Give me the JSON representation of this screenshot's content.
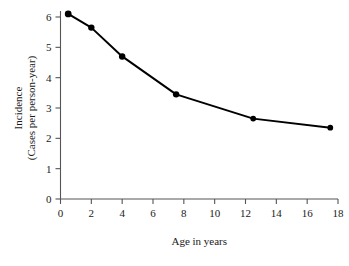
{
  "chart_data": {
    "type": "line",
    "title": "",
    "xlabel": "Age in years",
    "ylabel_line1": "Incidence",
    "ylabel_line2": "(Cases per person-year)",
    "x": [
      0.5,
      2.0,
      4.0,
      7.5,
      12.5,
      17.5
    ],
    "values": [
      6.1,
      5.65,
      4.7,
      3.45,
      2.65,
      2.35
    ],
    "series": [
      {
        "name": "Incidence",
        "x": [
          0.5,
          2.0,
          4.0,
          7.5,
          12.5,
          17.5
        ],
        "values": [
          6.1,
          5.65,
          4.7,
          3.45,
          2.65,
          2.35
        ]
      }
    ],
    "xlim": [
      0,
      18
    ],
    "ylim": [
      0,
      6
    ],
    "xticks": [
      0,
      2,
      4,
      6,
      8,
      10,
      12,
      14,
      16,
      18
    ],
    "yticks": [
      0,
      1,
      2,
      3,
      4,
      5,
      6
    ],
    "xtick_labels": [
      "0",
      "2",
      "4",
      "6",
      "8",
      "10",
      "12",
      "14",
      "16",
      "18"
    ],
    "ytick_labels": [
      "0",
      "1",
      "2",
      "3",
      "4",
      "5",
      "6"
    ],
    "grid": false,
    "legend": false,
    "legend_position": "none",
    "marker": "filled-circle",
    "line_color": "#000000",
    "marker_color": "#000000",
    "axis_color": "#555555",
    "background_color": "#ffffff"
  }
}
